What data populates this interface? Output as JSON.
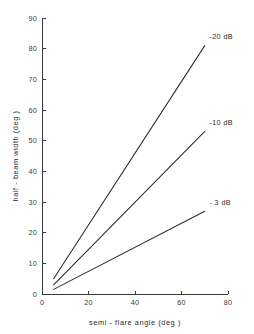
{
  "chart_data": {
    "type": "line",
    "title": "",
    "subtitle": "",
    "xlabel": "semi - flare angle (deg )",
    "ylabel": "half - beam width (deg )",
    "xlim": [
      0,
      80
    ],
    "ylim": [
      0,
      90
    ],
    "xticks": [
      0,
      20,
      40,
      60,
      80
    ],
    "yticks": [
      0,
      10,
      20,
      30,
      40,
      50,
      60,
      70,
      80,
      90
    ],
    "xtick_labels": [
      "0",
      "20",
      "40",
      "60",
      "80"
    ],
    "ytick_labels": [
      "0",
      "10",
      "20",
      "30",
      "40",
      "50",
      "60",
      "70",
      "80",
      "90"
    ],
    "grid": false,
    "legend_position": "inline-right-of-line-end",
    "series": [
      {
        "name": "-20 dB",
        "label": "-20 dB",
        "x": [
          5,
          70
        ],
        "y": [
          5,
          81
        ],
        "label_x": 72,
        "label_y": 84
      },
      {
        "name": "-10 dB",
        "label": "-10 dB",
        "x": [
          5,
          70
        ],
        "y": [
          3,
          53
        ],
        "label_x": 72,
        "label_y": 56
      },
      {
        "name": "-3 dB",
        "label": "- 3 dB",
        "x": [
          5,
          70
        ],
        "y": [
          1.5,
          27
        ],
        "label_x": 72,
        "label_y": 30
      }
    ],
    "colors": {
      "line": "#2b2b2b",
      "axis": "#3a3a3a",
      "text": "#2b2b2b",
      "background": "#ffffff"
    }
  }
}
